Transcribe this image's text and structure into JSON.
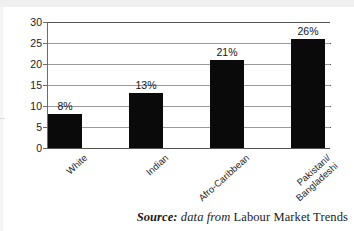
{
  "chart_data": {
    "type": "bar",
    "title": "",
    "subtitle": "",
    "xlabel": "",
    "ylabel": "",
    "ylim": [
      0,
      30
    ],
    "yticks": [
      0,
      5,
      10,
      15,
      20,
      25,
      30
    ],
    "ytick_labels": [
      "0",
      "5",
      "10",
      "15",
      "20",
      "25",
      "30"
    ],
    "grid": true,
    "legend": false,
    "orientation": "vertical",
    "bar_color": "#0a0a0a",
    "categories": [
      "White",
      "Indian",
      "Afro-Caribbean",
      "Pakistani/\nBangladeshi"
    ],
    "values": [
      8,
      13,
      21,
      26
    ],
    "data_labels": [
      "8%",
      "13%",
      "21%",
      "26%"
    ],
    "points": [
      {
        "category": "White",
        "value": 8,
        "label": "8%"
      },
      {
        "category": "Indian",
        "value": 13,
        "label": "13%"
      },
      {
        "category": "Afro-Caribbean",
        "value": 21,
        "label": "21%"
      },
      {
        "category": "Pakistani/\nBangladeshi",
        "value": 26,
        "label": "26%"
      }
    ],
    "annotations": []
  },
  "caption": {
    "source_word": "Source:",
    "middle": " data from ",
    "publication": "Labour Market Trends"
  },
  "colors": {
    "bar": "#0a0a0a",
    "gridline": "#9a9a9a",
    "axis": "#545454",
    "text": "#1b1b1b",
    "background": "#ffffff"
  }
}
